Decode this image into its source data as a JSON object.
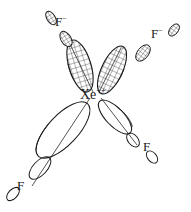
{
  "figure": {
    "type": "orbital-diagram",
    "background_color": "#ffffff",
    "stroke_color": "#1a1a1a",
    "width": 191,
    "height": 212
  },
  "central_atom": {
    "symbol": "Xe",
    "charge": "++",
    "name": "xenon-dication"
  },
  "ligands": [
    {
      "id": "f-topleft",
      "symbol": "F",
      "charge": "−",
      "position": "top-left",
      "shading": "hatched",
      "bonded": false
    },
    {
      "id": "f-topright",
      "symbol": "F",
      "charge": "−",
      "position": "top-right",
      "shading": "hatched",
      "bonded": false
    },
    {
      "id": "f-bottomright",
      "symbol": "F",
      "charge": "",
      "position": "bottom-right",
      "shading": "empty",
      "bonded": true
    },
    {
      "id": "f-bottomleft",
      "symbol": "F",
      "charge": "",
      "position": "bottom-left",
      "shading": "empty",
      "bonded": true
    }
  ],
  "central_orbitals": [
    {
      "id": "lobe-upper-left",
      "shading": "hatched",
      "size": "medium",
      "direction": "up-left"
    },
    {
      "id": "lobe-upper-right",
      "shading": "hatched",
      "size": "medium",
      "direction": "up-right"
    },
    {
      "id": "lobe-lower-left",
      "shading": "empty",
      "size": "large",
      "direction": "down-left"
    },
    {
      "id": "lobe-lower-right",
      "shading": "empty",
      "size": "small",
      "direction": "down-right"
    }
  ],
  "colors": {
    "stroke": "#1a1a1a",
    "hatch": "#3a3a3a",
    "background": "#ffffff"
  }
}
